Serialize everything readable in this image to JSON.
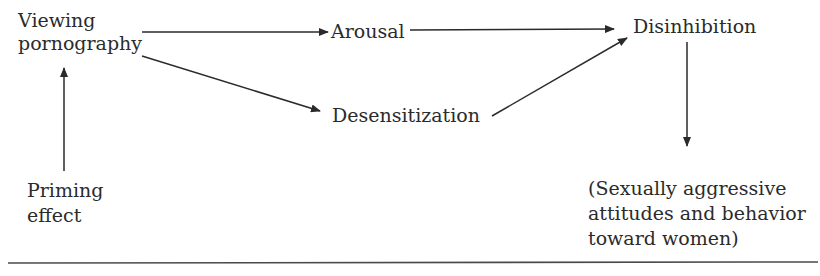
{
  "diagram": {
    "nodes": {
      "viewing": {
        "line1": "Viewing",
        "line2": "pornography"
      },
      "arousal": {
        "label": "Arousal"
      },
      "desensitization": {
        "label": "Desensitization"
      },
      "disinhibition": {
        "label": "Disinhibition"
      },
      "priming": {
        "line1": "Priming",
        "line2": "effect"
      },
      "outcome": {
        "line1": "(Sexually aggressive",
        "line2": "attitudes and behavior",
        "line3": "toward women)"
      }
    },
    "edges": [
      {
        "from": "viewing",
        "to": "arousal"
      },
      {
        "from": "viewing",
        "to": "desensitization"
      },
      {
        "from": "arousal",
        "to": "disinhibition"
      },
      {
        "from": "desensitization",
        "to": "disinhibition"
      },
      {
        "from": "priming",
        "to": "viewing"
      },
      {
        "from": "disinhibition",
        "to": "outcome"
      }
    ],
    "colors": {
      "line": "#2a2a2a",
      "text": "#2b2b2b"
    }
  }
}
